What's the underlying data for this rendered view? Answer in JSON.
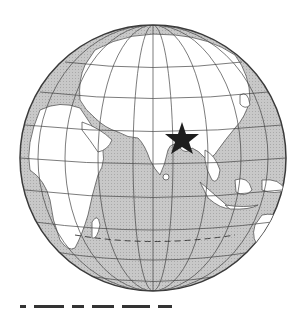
{
  "figure": {
    "type": "orthographic-globe",
    "center": {
      "x": 153,
      "y": 158
    },
    "radius": 133,
    "colors": {
      "ocean": "#c4c4c4",
      "land": "#ffffff",
      "outline": "#3a3a3a",
      "marker": "#1e1e1e"
    },
    "marker": {
      "shape": "star",
      "x": 182,
      "y": 140,
      "label": ""
    },
    "graticule": true,
    "dashed_parallel": "Tropic of Capricorn"
  },
  "caption": {
    "text": ""
  }
}
